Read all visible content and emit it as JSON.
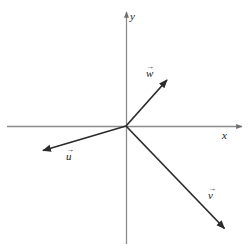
{
  "figure": {
    "type": "vector-diagram",
    "background_color": "#ffffff",
    "line_color": "#2b2b2b",
    "axis_color": "#8c8c8c",
    "width": 251,
    "height": 249
  },
  "axes": {
    "origin": {
      "x": 126,
      "y": 126
    },
    "x_axis": {
      "label": "x",
      "label_position": {
        "x": 222,
        "y": 130
      },
      "start": {
        "x": 7,
        "y": 126
      },
      "end": {
        "x": 245,
        "y": 126
      },
      "arrow_at_end": true
    },
    "y_axis": {
      "label": "y",
      "label_position": {
        "x": 130,
        "y": 11
      },
      "start": {
        "x": 126,
        "y": 244
      },
      "end": {
        "x": 126,
        "y": 8
      },
      "arrow_at_end": true
    }
  },
  "vectors": [
    {
      "name": "w",
      "label": "w",
      "accent": "→",
      "label_position": {
        "x": 146,
        "y": 68
      },
      "tail": {
        "x": 126,
        "y": 126
      },
      "tip": {
        "x": 171,
        "y": 76
      },
      "quadrant": "I"
    },
    {
      "name": "u",
      "label": "u",
      "accent": "→",
      "label_position": {
        "x": 66,
        "y": 151
      },
      "tail": {
        "x": 126,
        "y": 126
      },
      "tip": {
        "x": 38,
        "y": 152
      },
      "quadrant": "III"
    },
    {
      "name": "v",
      "label": "v",
      "accent": "→",
      "label_position": {
        "x": 208,
        "y": 190
      },
      "tail": {
        "x": 126,
        "y": 126
      },
      "tip": {
        "x": 229,
        "y": 233
      },
      "quadrant": "IV"
    }
  ]
}
